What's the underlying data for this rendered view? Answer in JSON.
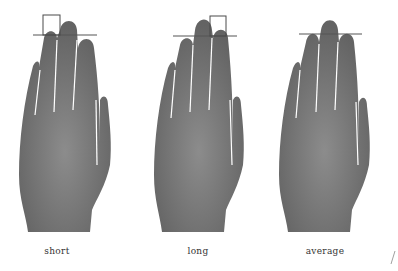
{
  "figures": [
    {
      "label": "short",
      "type": "ring finger shorter than index finger",
      "marker": "index"
    },
    {
      "label": "long",
      "type": "ring finger longer than index finger",
      "marker": "ring"
    },
    {
      "label": "average",
      "type": "ring and index fingers equal",
      "marker": "none"
    }
  ],
  "colors": {
    "hand": "#6e6e6e",
    "hand_highlight": "#8a8a8a",
    "guide_line": "#555555",
    "marker_box": "#4a4a4a",
    "label_text": "#333333",
    "background": "#ffffff"
  }
}
